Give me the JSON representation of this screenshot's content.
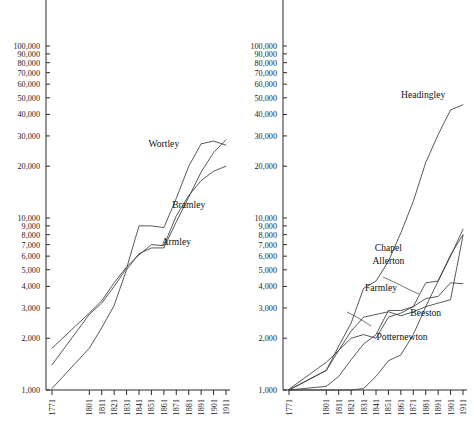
{
  "figure": {
    "panels": [
      "left",
      "right"
    ],
    "y_tick_labels": [
      "200,000",
      "100,000",
      "90,000",
      "80,000",
      "70,000",
      "60,000",
      "50,000",
      "40,000",
      "30,000",
      "20,000",
      "10,000",
      "9,000",
      "8,000",
      "7,000",
      "6,000",
      "5,000",
      "4,000",
      "3,000",
      "2,000",
      "1,000"
    ],
    "x_tick_labels": [
      "1771",
      "1801",
      "1811",
      "1821",
      "1831",
      "1841",
      "1851",
      "1861",
      "1871",
      "1881",
      "1891",
      "1901",
      "1911"
    ]
  },
  "chart_data": [
    {
      "type": "line",
      "title": "",
      "xlabel": "",
      "ylabel": "",
      "yscale": "log",
      "ylim": [
        1000,
        200000
      ],
      "grid": false,
      "legend": "inline-annotations",
      "x": [
        1771,
        1801,
        1811,
        1821,
        1831,
        1841,
        1851,
        1861,
        1871,
        1881,
        1891,
        1901,
        1911
      ],
      "yticks": [
        1000,
        2000,
        3000,
        4000,
        5000,
        6000,
        7000,
        8000,
        9000,
        10000,
        20000,
        30000,
        40000,
        50000,
        60000,
        70000,
        80000,
        90000,
        100000,
        200000
      ],
      "ytick_labels": [
        "1,000",
        "2,000",
        "3,000",
        "4,000",
        "5,000",
        "6,000",
        "7,000",
        "8,000",
        "9,000",
        "10,000",
        "20,000",
        "30,000",
        "40,000",
        "50,000",
        "60,000",
        "70,000",
        "80,000",
        "90,000",
        "100,000",
        "200,000"
      ],
      "series": [
        {
          "name": "Wortley",
          "values": [
            1400,
            2750,
            3200,
            4000,
            5100,
            9000,
            9000,
            8800,
            13000,
            20000,
            27000,
            28000,
            26500
          ]
        },
        {
          "name": "Bramley",
          "values": [
            1750,
            2800,
            3300,
            4200,
            5200,
            6100,
            7000,
            6900,
            10300,
            13500,
            16500,
            18700,
            20000
          ]
        },
        {
          "name": "Armley",
          "values": [
            1020,
            1750,
            2300,
            3100,
            5000,
            6200,
            6700,
            6700,
            9500,
            13200,
            18500,
            24000,
            28500
          ]
        }
      ],
      "annotations": [
        {
          "text": "Wortley",
          "x": 1861,
          "y": 26000
        },
        {
          "text": "Bramley",
          "x": 1881,
          "y": 11500
        },
        {
          "text": "Armley",
          "x": 1871,
          "y": 7000
        }
      ]
    },
    {
      "type": "line",
      "title": "",
      "xlabel": "",
      "ylabel": "",
      "yscale": "log",
      "ylim": [
        1000,
        200000
      ],
      "grid": false,
      "legend": "inline-annotations",
      "x": [
        1771,
        1801,
        1811,
        1821,
        1831,
        1841,
        1851,
        1861,
        1871,
        1881,
        1891,
        1901,
        1911
      ],
      "yticks": [
        1000,
        2000,
        3000,
        4000,
        5000,
        6000,
        7000,
        8000,
        9000,
        10000,
        20000,
        30000,
        40000,
        50000,
        60000,
        70000,
        80000,
        90000,
        100000,
        200000
      ],
      "ytick_labels": [
        "1,000",
        "2,000",
        "3,000",
        "4,000",
        "5,000",
        "6,000",
        "7,000",
        "8,000",
        "9,000",
        "10,000",
        "20,000",
        "30,000",
        "40,000",
        "50,000",
        "60,000",
        "70,000",
        "80,000",
        "90,000",
        "100,000",
        "200,000"
      ],
      "series": [
        {
          "name": "Headingley",
          "values": [
            1000,
            1300,
            1800,
            2450,
            3900,
            4300,
            5600,
            8200,
            12500,
            21000,
            30500,
            42500,
            45500
          ]
        },
        {
          "name": "Chapel Allerton",
          "values": [
            1010,
            1450,
            1700,
            2000,
            2100,
            2000,
            2650,
            2800,
            3050,
            4200,
            4300,
            6000,
            8600
          ]
        },
        {
          "name": "Farmley",
          "values": [
            1000,
            1050,
            1200,
            1500,
            1850,
            2100,
            2900,
            2900,
            3050,
            3400,
            3500,
            4200,
            4150
          ]
        },
        {
          "name": "Beeston",
          "values": [
            1000,
            1300,
            1700,
            2200,
            2650,
            2750,
            2850,
            2700,
            2850,
            3050,
            3200,
            3350,
            7900
          ]
        },
        {
          "name": "Potternewton",
          "values": [
            1000,
            1000,
            1000,
            1000,
            1020,
            1200,
            1480,
            1600,
            2100,
            3050,
            4300,
            6100,
            8000
          ]
        }
      ],
      "annotations": [
        {
          "text": "Headingley",
          "x": 1879,
          "y": 50000
        },
        {
          "text": "Chapel",
          "x": 1851,
          "y": 6400
        },
        {
          "text": "Allerton",
          "x": 1851,
          "y": 5400
        },
        {
          "text": "Farmley",
          "x": 1845,
          "y": 3750
        },
        {
          "text": "Beeston",
          "x": 1881,
          "y": 2700
        },
        {
          "text": "Potternewton",
          "x": 1862,
          "y": 1950
        }
      ]
    }
  ]
}
